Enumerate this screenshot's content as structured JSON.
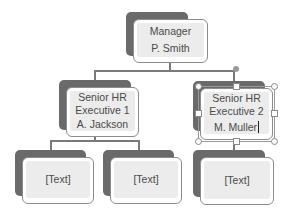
{
  "diagram": {
    "type": "org-chart",
    "colors": {
      "shadow": "#6a6a6a",
      "card_fill": "#ececec",
      "card_border": "#8c8c8c",
      "connector": "#7a7a7a",
      "text": "#4a4a4a"
    },
    "manager": {
      "title": "Manager",
      "name": "P. Smith"
    },
    "executives": [
      {
        "title_line1": "Senior HR",
        "title_line2": "Executive 1",
        "name": "A. Jackson"
      },
      {
        "title_line1": "Senior HR",
        "title_line2": "Executive 2",
        "name": "M. Muller",
        "selected": true,
        "editing": true
      }
    ],
    "reports": [
      {
        "label": "[Text]",
        "parent": "Executive 1"
      },
      {
        "label": "[Text]",
        "parent": "Executive 1"
      },
      {
        "label": "[Text]",
        "parent": "Executive 2"
      }
    ]
  }
}
